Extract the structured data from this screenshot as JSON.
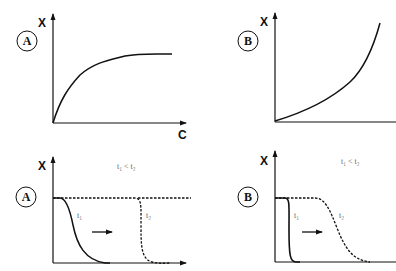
{
  "panels": {
    "top_left": {
      "badge": "A",
      "y_axis": "X",
      "x_axis": "C"
    },
    "top_right": {
      "badge": "B",
      "y_axis": "X",
      "x_axis": "C"
    },
    "bottom_left": {
      "badge": "A",
      "y_axis": "X",
      "x_axis": "t",
      "condition": "t₁ < t₂",
      "curve1": "t₁",
      "curve2": "t₂"
    },
    "bottom_right": {
      "badge": "B",
      "y_axis": "X",
      "x_axis": "t",
      "condition": "t₁ < t₂",
      "curve1": "t₁",
      "curve2": "t₂"
    }
  },
  "colors": {
    "ink": "#111111",
    "label": "#666666"
  }
}
